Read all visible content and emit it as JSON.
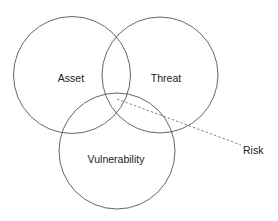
{
  "diagram": {
    "type": "venn",
    "stroke_color": "#555555",
    "background": "#ffffff",
    "circles": [
      {
        "id": "asset",
        "label": "Asset",
        "cx": 72,
        "cy": 75,
        "r": 58.5
      },
      {
        "id": "threat",
        "label": "Threat",
        "cx": 160,
        "cy": 75,
        "r": 58
      },
      {
        "id": "vulnerability",
        "label": "Vulnerability",
        "cx": 117,
        "cy": 151,
        "r": 58
      }
    ],
    "callout": {
      "label": "Risk",
      "line_style": "dashed",
      "from": [
        117,
        99
      ],
      "to": [
        241,
        145
      ]
    }
  }
}
